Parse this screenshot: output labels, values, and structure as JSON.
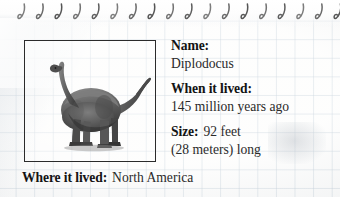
{
  "card": {
    "title": "Dinosaur fact card",
    "paper_style": "graph-paper",
    "binding": {
      "name": "spiral-binding",
      "ring_count": 18,
      "ring_color": "#4a4a4a"
    },
    "frame": {
      "name": "dinosaur-photo-frame",
      "border_color": "#2b2b2b"
    },
    "image": {
      "name": "diplodocus-photo",
      "subject": "Diplodocus",
      "description": "grayscale sauropod dinosaur standing in profile facing left",
      "body_color": "#5d5d5d",
      "shadow_color": "#2e2e2e",
      "highlight_color": "#9a9a9a"
    }
  },
  "facts": [
    {
      "id": "name",
      "label": "Name:",
      "value": "Diplodocus",
      "layout": "stacked"
    },
    {
      "id": "when-it-lived",
      "label": "When it lived:",
      "value": "145 million years ago",
      "layout": "stacked"
    },
    {
      "id": "size",
      "label": "Size:",
      "value": "92 feet",
      "value_line2": "(28 meters) long",
      "layout": "inline"
    }
  ],
  "bottom_fact": {
    "id": "where-it-lived",
    "label": "Where it lived:",
    "value": "North America"
  },
  "colors": {
    "grid_line": "#96acbe",
    "paper": "#fcfcfb",
    "label_text": "#141414",
    "value_text": "#2a2a2a",
    "frame_border": "#2b2b2b"
  }
}
